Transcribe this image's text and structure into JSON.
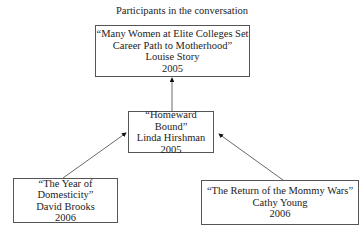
{
  "title": "Participants in the conversation",
  "nodes": {
    "story": {
      "title": "“Many Women at Elite Colleges Set Career Path to Motherhood”",
      "title_line1": "“Many Women at Elite Colleges Set",
      "title_line2": "Career Path to Motherhood”",
      "author": "Louise Story",
      "year": "2005"
    },
    "hirshman": {
      "title": "“Homeward Bound”",
      "author": "Linda Hirshman",
      "year": "2005"
    },
    "brooks": {
      "title": "“The Year of Domesticity”",
      "author": "David Brooks",
      "year": "2006"
    },
    "young": {
      "title": "“The Return of the Mommy Wars”",
      "author": "Cathy Young",
      "year": "2006"
    }
  },
  "edges": [
    {
      "from": "hirshman",
      "to": "story"
    },
    {
      "from": "brooks",
      "to": "hirshman"
    },
    {
      "from": "young",
      "to": "hirshman"
    }
  ]
}
